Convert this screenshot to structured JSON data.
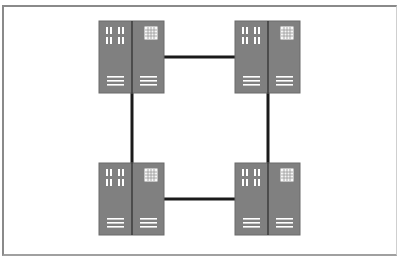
{
  "diagram": {
    "type": "network-topology",
    "topology": "ring",
    "colors": {
      "server_body": "#808080",
      "server_divider": "#2a2a2a",
      "server_detail": "#ffffff",
      "link": "#1a1a1a",
      "frame": "#8a8a8a",
      "background": "#ffffff"
    },
    "nodes": [
      {
        "id": "server-top-left",
        "icon": "server-rack-icon",
        "position": "top-left"
      },
      {
        "id": "server-top-right",
        "icon": "server-rack-icon",
        "position": "top-right"
      },
      {
        "id": "server-bottom-left",
        "icon": "server-rack-icon",
        "position": "bottom-left"
      },
      {
        "id": "server-bottom-right",
        "icon": "server-rack-icon",
        "position": "bottom-right"
      }
    ],
    "links": [
      {
        "from": "server-top-left",
        "to": "server-top-right"
      },
      {
        "from": "server-top-right",
        "to": "server-bottom-right"
      },
      {
        "from": "server-bottom-right",
        "to": "server-bottom-left"
      },
      {
        "from": "server-bottom-left",
        "to": "server-top-left"
      }
    ]
  }
}
